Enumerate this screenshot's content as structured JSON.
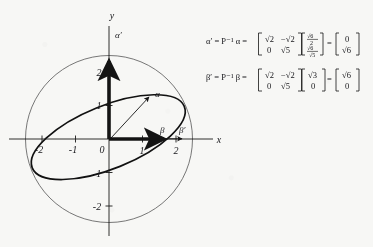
{
  "figure": {
    "type": "math-diagram",
    "axes": {
      "x_label": "x",
      "y_label": "y",
      "origin_label": "0",
      "x_ticks": [
        "-2",
        "-1",
        "0",
        "1",
        "2"
      ],
      "y_ticks": [
        "2",
        "1",
        "-1",
        "-2"
      ],
      "x_range": [
        -2.9,
        2.6
      ],
      "y_range": [
        -2.7,
        2.6
      ]
    },
    "vectors": [
      {
        "name": "alpha",
        "label": "α",
        "from": [
          0,
          0
        ],
        "to": [
          1.2,
          1.28
        ],
        "style": "thin-arrow"
      },
      {
        "name": "alpha-prime",
        "label": "α′",
        "from": [
          0,
          0
        ],
        "to": [
          0,
          2.45
        ],
        "style": "thick-arrow"
      },
      {
        "name": "beta",
        "label": "β",
        "from": [
          0,
          0
        ],
        "to": [
          1.8,
          0
        ],
        "style": "thick-arrow"
      },
      {
        "name": "beta-prime",
        "label": "β′",
        "from": [
          0,
          0
        ],
        "to": [
          2.3,
          0
        ],
        "style": "thin-arrow"
      }
    ],
    "curves": [
      {
        "name": "circle",
        "type": "circle",
        "radius": 2.5,
        "center": [
          0,
          0
        ],
        "stroke": "#4a4a4a",
        "width": 0.7
      },
      {
        "name": "ellipse",
        "type": "ellipse",
        "center": [
          0,
          -0.07
        ],
        "semi_major": 2.45,
        "semi_minor": 0.95,
        "rotation_deg": -22,
        "stroke": "#141414",
        "width": 1.6
      }
    ]
  },
  "equations": {
    "alpha": {
      "lhs": "α′ = P⁻¹ α =",
      "matrix": [
        [
          "√2",
          "−√2"
        ],
        [
          "0",
          "√5"
        ]
      ],
      "vector_in": [
        "√6⁄2",
        "√6⁄√5"
      ],
      "vector_in_num": [
        "√6",
        "√6"
      ],
      "vector_in_den": [
        "2",
        "√5"
      ],
      "equals": "=",
      "vector_out": [
        "0",
        "√6"
      ]
    },
    "beta": {
      "lhs": "β′ = P⁻¹ β =",
      "matrix": [
        [
          "√2",
          "−√2"
        ],
        [
          "0",
          "√5"
        ]
      ],
      "vector_in": [
        "√3",
        "0"
      ],
      "equals": "=",
      "vector_out": [
        "√6",
        "0"
      ]
    }
  },
  "colors": {
    "ink": "#141414",
    "light_ink": "#4a4a4a",
    "paper": "#f7f7f5"
  }
}
